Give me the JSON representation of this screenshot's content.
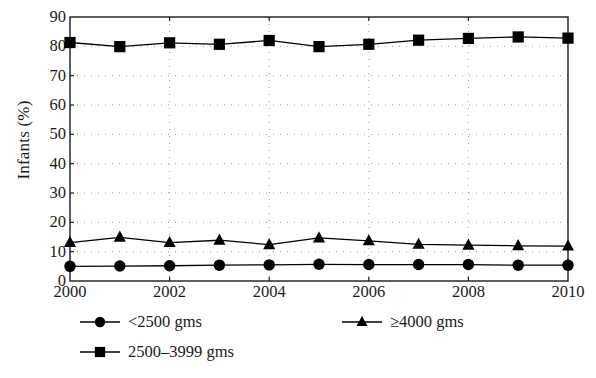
{
  "chart_data": {
    "type": "line",
    "title": "",
    "xlabel": "",
    "ylabel": "Infants (%)",
    "x": [
      2000,
      2001,
      2002,
      2003,
      2004,
      2005,
      2006,
      2007,
      2008,
      2009,
      2010
    ],
    "xtick_labels": [
      "2000",
      "2002",
      "2004",
      "2006",
      "2008",
      "2010"
    ],
    "xticks": [
      2000,
      2002,
      2004,
      2006,
      2008,
      2010
    ],
    "xlim": [
      2000,
      2010
    ],
    "ylim": [
      0,
      90
    ],
    "yticks": [
      0,
      10,
      20,
      30,
      40,
      50,
      60,
      70,
      80,
      90
    ],
    "ytick_labels": [
      "0",
      "10",
      "20",
      "30",
      "40",
      "50",
      "60",
      "70",
      "80",
      "90"
    ],
    "grid": "dotted both axes",
    "legend_position": "below plot",
    "series": [
      {
        "name": "<2500 gms",
        "marker": "circle",
        "color": "#000000",
        "values": [
          5.0,
          5.1,
          5.2,
          5.4,
          5.5,
          5.7,
          5.6,
          5.6,
          5.6,
          5.4,
          5.4
        ]
      },
      {
        "name": "2500-3999 gms",
        "marker": "square",
        "color": "#000000",
        "values": [
          81.3,
          79.9,
          81.2,
          80.7,
          82.0,
          79.9,
          80.7,
          82.1,
          82.7,
          83.2,
          82.8
        ]
      },
      {
        "name": "≥4000 gms",
        "marker": "triangle",
        "color": "#000000",
        "values": [
          13.1,
          14.9,
          13.1,
          13.9,
          12.4,
          14.7,
          13.7,
          12.5,
          12.2,
          12.0,
          11.9
        ]
      }
    ]
  },
  "legend": {
    "entries": [
      {
        "label": "<2500 gms",
        "marker": "circle"
      },
      {
        "label": "2500–3999 gms",
        "marker": "square"
      },
      {
        "label": "≥4000 gms",
        "marker": "triangle"
      }
    ]
  }
}
